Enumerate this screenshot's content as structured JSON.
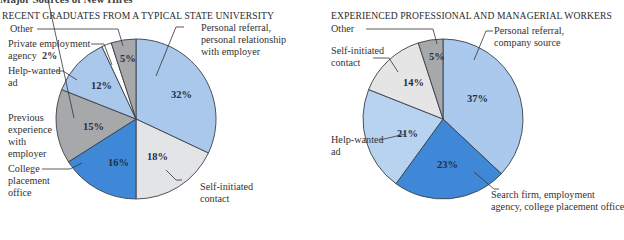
{
  "page": {
    "clipped_heading": "Major Sources of New Hires"
  },
  "chart_data": [
    {
      "type": "pie",
      "title": "RECENT GRADUATES FROM A TYPICAL STATE UNIVERSITY",
      "start_angle": "12 o'clock",
      "direction": "clockwise",
      "slices": [
        {
          "label": "Personal referral, personal relationship with employer",
          "value": 32,
          "color": "#a9c8eb"
        },
        {
          "label": "Self-initiated contact",
          "value": 18,
          "color": "#e3e4e6"
        },
        {
          "label": "College placement office",
          "value": 16,
          "color": "#3f88d8"
        },
        {
          "label": "Previous experience with employer",
          "value": 15,
          "color": "#a7a8aa"
        },
        {
          "label": "Help-wanted ad",
          "value": 12,
          "color": "#a9c8eb"
        },
        {
          "label": "Private employment agency",
          "value": 2,
          "color": "#ffffff"
        },
        {
          "label": "Other",
          "value": 5,
          "color": "#a7a8aa"
        }
      ]
    },
    {
      "type": "pie",
      "title": "EXPERIENCED PROFESSIONAL AND MANAGERIAL WORKERS",
      "start_angle": "12 o'clock",
      "direction": "clockwise",
      "slices": [
        {
          "label": "Personal referral, company source",
          "value": 37,
          "color": "#aac9ec"
        },
        {
          "label": "Search firm, employment agency, college placement office",
          "value": 23,
          "color": "#3f88d8"
        },
        {
          "label": "Help-wanted ad",
          "value": 21,
          "color": "#b8d3f0"
        },
        {
          "label": "Self-initiated contact",
          "value": 14,
          "color": "#e5e5e6"
        },
        {
          "label": "Other",
          "value": 5,
          "color": "#a7a8aa"
        }
      ]
    }
  ],
  "left": {
    "title": "RECENT GRADUATES FROM A TYPICAL STATE UNIVERSITY",
    "labels": {
      "other": "Other",
      "private_1": "Private employment",
      "private_2": "agency",
      "private_pct": "2%",
      "helpwanted_1": "Help-wanted",
      "helpwanted_2": "ad",
      "previous_1": "Previous",
      "previous_2": "experience",
      "previous_3": "with",
      "previous_4": "employer",
      "college_1": "College",
      "college_2": "placement",
      "college_3": "office",
      "referral_1": "Personal referral,",
      "referral_2": "personal relationship",
      "referral_3": "with employer",
      "self_1": "Self-initiated",
      "self_2": "contact"
    },
    "pcts": {
      "referral": "32%",
      "self": "18%",
      "college": "16%",
      "previous": "15%",
      "helpwanted": "12%",
      "other": "5%"
    }
  },
  "right": {
    "title": "EXPERIENCED PROFESSIONAL AND MANAGERIAL WORKERS",
    "labels": {
      "other": "Other",
      "self_1": "Self-initiated",
      "self_2": "contact",
      "helpwanted_1": "Help-wanted",
      "helpwanted_2": "ad",
      "referral_1": "Personal referral,",
      "referral_2": "company source",
      "search_1": "Search firm, employment",
      "search_2": "agency, college placement office"
    },
    "pcts": {
      "referral": "37%",
      "search": "23%",
      "helpwanted": "21%",
      "self": "14%",
      "other": "5%"
    }
  }
}
